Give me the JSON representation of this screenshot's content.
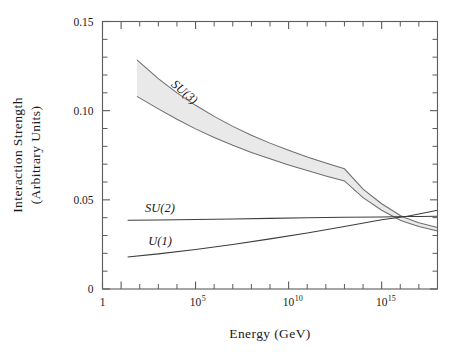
{
  "chart_data": {
    "type": "line",
    "title": "",
    "xlabel": "Energy (GeV)",
    "ylabel_line1": "Interaction Strength",
    "ylabel_line2": "(Arbitrary Units)",
    "xscale": "log",
    "xlim": [
      1,
      1e+18
    ],
    "ylim": [
      0,
      0.15
    ],
    "grid": false,
    "legend": "inline-curve-labels",
    "x_tick_labels": [
      {
        "value": 1,
        "mantissa": "1",
        "exponent": ""
      },
      {
        "value": 100000.0,
        "mantissa": "10",
        "exponent": "5"
      },
      {
        "value": 10000000000.0,
        "mantissa": "10",
        "exponent": "10"
      },
      {
        "value": 1000000000000000.0,
        "mantissa": "10",
        "exponent": "15"
      }
    ],
    "x_minor_decades": [
      1,
      2,
      3,
      4,
      5,
      6,
      7,
      8,
      9,
      10,
      11,
      12,
      13,
      14,
      15,
      16,
      17,
      18
    ],
    "y_tick_labels": [
      "0",
      "0.05",
      "0.10",
      "0.15"
    ],
    "y_tick_values": [
      0,
      0.05,
      0.1,
      0.15
    ],
    "y_minor_step": 0.01,
    "band_fill_color": "#e9e9e9",
    "band_edge_color": "#6f6f6f",
    "curve_color": "#3d3d3d",
    "frame_color": "#5b5b5b",
    "series": [
      {
        "name": "SU(3)",
        "label": "SU(3)",
        "label_rotation_deg": 40,
        "type": "band",
        "x_log10": [
          1.85,
          3,
          4,
          5,
          6,
          7,
          8,
          9,
          10,
          11,
          12,
          13,
          14,
          15,
          16,
          16.3,
          17,
          18
        ],
        "upper": [
          0.1285,
          0.118,
          0.11,
          0.103,
          0.0968,
          0.0912,
          0.0862,
          0.0818,
          0.0778,
          0.074,
          0.0706,
          0.0674,
          0.056,
          0.0478,
          0.0412,
          0.0398,
          0.0372,
          0.0345
        ],
        "lower": [
          0.108,
          0.101,
          0.0952,
          0.0898,
          0.085,
          0.0806,
          0.0766,
          0.073,
          0.0696,
          0.0664,
          0.0634,
          0.0606,
          0.0512,
          0.0442,
          0.0386,
          0.0375,
          0.035,
          0.0325
        ]
      },
      {
        "name": "SU(2)",
        "label": "SU(2)",
        "type": "line",
        "x_log10": [
          1.35,
          3,
          5,
          7,
          9,
          11,
          13,
          15,
          16.3,
          17,
          18
        ],
        "values": [
          0.0385,
          0.0387,
          0.039,
          0.0393,
          0.0396,
          0.0399,
          0.0402,
          0.0404,
          0.0406,
          0.0407,
          0.0408
        ]
      },
      {
        "name": "U(1)",
        "label": "U(1)",
        "type": "line",
        "x_log10": [
          1.35,
          3,
          5,
          7,
          9,
          11,
          13,
          15,
          16.3,
          17,
          18
        ],
        "values": [
          0.018,
          0.0197,
          0.0222,
          0.025,
          0.0281,
          0.0314,
          0.035,
          0.0388,
          0.0406,
          0.042,
          0.0442
        ]
      }
    ],
    "annotations": [
      {
        "text": "SU(3)",
        "x_px": 182,
        "y_px": 95,
        "rotation": 40
      },
      {
        "text": "SU(2)",
        "x_px": 160,
        "y_px": 212,
        "rotation": 0
      },
      {
        "text": "U(1)",
        "x_px": 160,
        "y_px": 245,
        "rotation": 0
      }
    ],
    "convergence_point": {
      "x_log10": 16.3,
      "value": 0.04
    }
  }
}
